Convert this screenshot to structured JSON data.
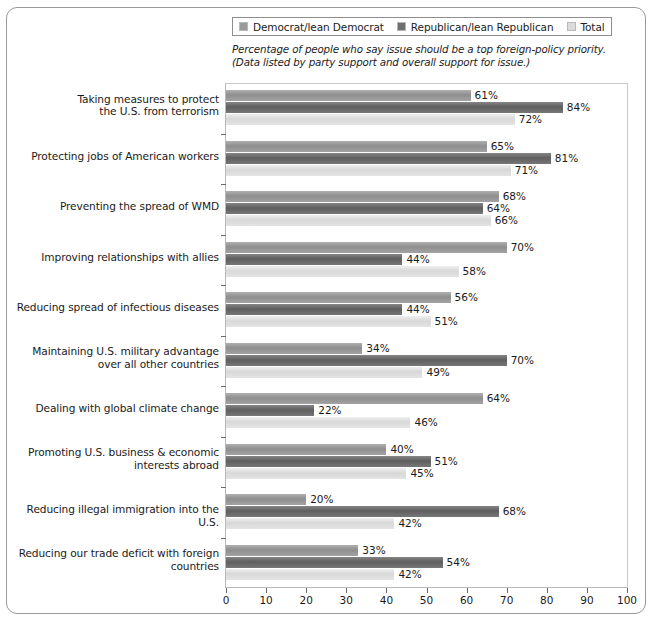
{
  "legend": {
    "items": [
      {
        "label": "Democrat/lean Democrat",
        "color": "#9a9a9a",
        "key": "democrat"
      },
      {
        "label": "Republican/lean Republican",
        "color": "#6e6e6e",
        "key": "republican"
      },
      {
        "label": "Total",
        "color": "#dcdcdc",
        "key": "total"
      }
    ]
  },
  "subtitle": "Percentage of people who say issue should be a top foreign-policy priority.(Data listed by party support and overall support for issue.)",
  "chart_data": {
    "type": "bar",
    "orientation": "horizontal",
    "title": "",
    "subtitle": "Percentage of people who say issue should be a top foreign-policy priority.(Data listed by party support and overall support for issue.)",
    "xlabel": "",
    "ylabel": "",
    "xlim": [
      0,
      100
    ],
    "xticks": [
      0,
      10,
      20,
      30,
      40,
      50,
      60,
      70,
      80,
      90,
      100
    ],
    "xticklabels": [
      "0",
      "10",
      "20",
      "30",
      "40",
      "50",
      "60",
      "70",
      "80",
      "90",
      "100"
    ],
    "grid": false,
    "legend_position": "top",
    "value_suffix": "%",
    "categories": [
      "Taking measures to protect the U.S. from terrorism",
      "Protecting jobs of American workers",
      "Preventing the spread of WMD",
      "Improving relationships with allies",
      "Reducing spread of infectious diseases",
      "Maintaining U.S. military advantage over all other countries",
      "Dealing with global climate change",
      "Promoting U.S. business & economic interests abroad",
      "Reducing illegal immigration into the U.S.",
      "Reducing our trade deficit with foreign countries"
    ],
    "category_lines": [
      [
        "Taking measures to protect",
        "the U.S. from terrorism"
      ],
      [
        "Protecting jobs of American workers"
      ],
      [
        "Preventing the spread of WMD"
      ],
      [
        "Improving relationships with allies"
      ],
      [
        "Reducing spread of infectious diseases"
      ],
      [
        "Maintaining U.S. military advantage",
        "over all other countries"
      ],
      [
        "Dealing with global climate change"
      ],
      [
        "Promoting U.S. business & economic",
        "interests abroad"
      ],
      [
        "Reducing illegal immigration into the U.S."
      ],
      [
        "Reducing our trade deficit with foreign",
        "countries"
      ]
    ],
    "series": [
      {
        "name": "Democrat/lean Democrat",
        "color": "#9a9a9a",
        "values": [
          61,
          65,
          68,
          70,
          56,
          34,
          64,
          40,
          20,
          33
        ]
      },
      {
        "name": "Republican/lean Republican",
        "color": "#6e6e6e",
        "values": [
          84,
          81,
          64,
          44,
          44,
          70,
          22,
          51,
          68,
          54
        ]
      },
      {
        "name": "Total",
        "color": "#dcdcdc",
        "values": [
          72,
          71,
          66,
          58,
          51,
          49,
          46,
          45,
          42,
          42
        ]
      }
    ],
    "labels": {
      "democrat": [
        "61%",
        "65%",
        "68%",
        "70%",
        "56%",
        "34%",
        "64%",
        "40%",
        "20%",
        "33%"
      ],
      "republican": [
        "84%",
        "81%",
        "64%",
        "44%",
        "44%",
        "70%",
        "22%",
        "51%",
        "68%",
        "54%"
      ],
      "total": [
        "72%",
        "71%",
        "66%",
        "58%",
        "51%",
        "49%",
        "46%",
        "45%",
        "42%",
        "42%"
      ]
    }
  }
}
